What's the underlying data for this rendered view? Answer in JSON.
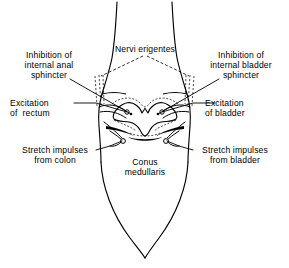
{
  "figure": {
    "background_color": "#ffffff",
    "ink_color": "#000000",
    "width": 289,
    "height": 268
  },
  "labels": {
    "nervi_erigentes": "Nervi erigentes",
    "inhibition_internal_anal_sphincter": "Inhibition of\ninternal anal\nsphincter",
    "inhibition_internal_bladder_sphincter": "Inhibition of\ninternal bladder\nsphincter",
    "excitation_of_rectum": "Excitation\nof  rectum",
    "excitation_of_bladder": "Excitation\nof bladder",
    "stretch_impulses_from_colon": "Stretch impulses\nfrom colon",
    "stretch_impulses_from_bladder": "Stretch impulses\nfrom bladder",
    "conus_medullaris": "Conus\nmedullaris"
  },
  "structures": {
    "spinal_cord_outline": "spinal-cord-outline",
    "gray_matter": "butterfly-gray-matter",
    "anterior_commissure": "anterior-commissure",
    "left_nerve_root": "left-nerve-root-bundle",
    "right_nerve_root": "right-nerve-root-bundle",
    "left_synapse_marker": "left-synapse-circle",
    "right_synapse_marker": "right-synapse-circle",
    "filum_terminale_tip": "conus-tip"
  }
}
